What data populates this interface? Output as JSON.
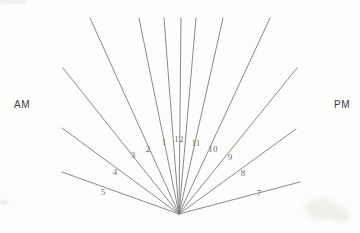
{
  "figure": {
    "name": "sundial-hour-line-diagram",
    "background_color": "#fdfdfb",
    "line_color": "#7b7d7e",
    "label_color": "#6f7172",
    "meridiem_color": "#3b3b3b",
    "center": {
      "x": 179,
      "y": 214
    }
  },
  "meridiem": {
    "am": {
      "text": "AM",
      "x": 22,
      "y": 105
    },
    "pm": {
      "text": "PM",
      "x": 342,
      "y": 105
    }
  },
  "chart_data": {
    "type": "line",
    "title": "",
    "xlabel": "",
    "ylabel": "",
    "center": {
      "x": 179,
      "y": 214
    },
    "categories": [
      "1",
      "2",
      "3",
      "4",
      "5",
      "6",
      "7",
      "8",
      "9",
      "10",
      "11",
      "12"
    ],
    "rays": [
      {
        "hour": "6",
        "label": "",
        "x1": 62,
        "y1": 172,
        "x2": 179,
        "y2": 214,
        "label_x": 0,
        "label_y": 0
      },
      {
        "hour": "5",
        "label": "5",
        "x1": 62,
        "y1": 128,
        "x2": 179,
        "y2": 214,
        "label_x": 103,
        "label_y": 192
      },
      {
        "hour": "4",
        "label": "4",
        "x1": 63,
        "y1": 68,
        "x2": 179,
        "y2": 214,
        "label_x": 115,
        "label_y": 172
      },
      {
        "hour": "3",
        "label": "3",
        "x1": 90,
        "y1": 18,
        "x2": 179,
        "y2": 214,
        "label_x": 133,
        "label_y": 155
      },
      {
        "hour": "2",
        "label": "2",
        "x1": 139,
        "y1": 18,
        "x2": 179,
        "y2": 214,
        "label_x": 148,
        "label_y": 149
      },
      {
        "hour": "1",
        "label": "1",
        "x1": 164,
        "y1": 18,
        "x2": 179,
        "y2": 214,
        "label_x": 164,
        "label_y": 142
      },
      {
        "hour": "12",
        "label": "12",
        "x1": 181,
        "y1": 18,
        "x2": 179,
        "y2": 214,
        "label_x": 179,
        "label_y": 139
      },
      {
        "hour": "11",
        "label": "11",
        "x1": 196,
        "y1": 18,
        "x2": 179,
        "y2": 214,
        "label_x": 196,
        "label_y": 143
      },
      {
        "hour": "10",
        "label": "10",
        "x1": 223,
        "y1": 18,
        "x2": 179,
        "y2": 214,
        "label_x": 213,
        "label_y": 149
      },
      {
        "hour": "9",
        "label": "9",
        "x1": 270,
        "y1": 18,
        "x2": 179,
        "y2": 214,
        "label_x": 230,
        "label_y": 157
      },
      {
        "hour": "8",
        "label": "8",
        "x1": 297,
        "y1": 68,
        "x2": 179,
        "y2": 214,
        "label_x": 243,
        "label_y": 173
      },
      {
        "hour": "7",
        "label": "7",
        "x1": 296,
        "y1": 129,
        "x2": 179,
        "y2": 214,
        "label_x": 259,
        "label_y": 193
      },
      {
        "hour": "6b",
        "label": "",
        "x1": 300,
        "y1": 182,
        "x2": 179,
        "y2": 214,
        "label_x": 0,
        "label_y": 0
      }
    ]
  }
}
